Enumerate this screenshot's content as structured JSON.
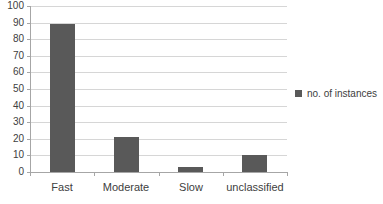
{
  "chart_data": {
    "type": "bar",
    "title": "",
    "xlabel": "",
    "ylabel": "",
    "categories": [
      "Fast",
      "Moderate",
      "Slow",
      "unclassified"
    ],
    "series": [
      {
        "name": "no. of instances",
        "values": [
          89,
          21,
          3,
          10
        ]
      }
    ],
    "ylim": [
      0,
      100
    ],
    "ytick_step": 10,
    "grid": true,
    "legend_position": "right",
    "colors": {
      "bar": "#595959",
      "gridline": "#d6d6d6",
      "axis": "#a6a6a6",
      "text": "#404040"
    }
  },
  "legend": {
    "label": "no. of instances"
  }
}
